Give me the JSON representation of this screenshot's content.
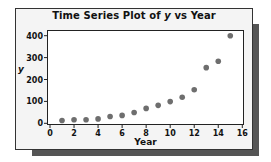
{
  "chart_data": {
    "type": "scatter",
    "title": "Time Series Plot of y vs Year",
    "title_parts": {
      "prefix": "Time Series Plot of ",
      "var": "y",
      "suffix": " vs Year"
    },
    "xlabel": "Year",
    "ylabel": "y",
    "xlim": [
      0,
      16
    ],
    "ylim": [
      0,
      400
    ],
    "xticks": [
      0,
      2,
      4,
      6,
      8,
      10,
      12,
      14,
      16
    ],
    "yticks": [
      0,
      100,
      200,
      300,
      400
    ],
    "grid": false,
    "legend": null,
    "series": [
      {
        "name": "y",
        "color": "#6e6e6e",
        "x": [
          1,
          2,
          3,
          4,
          5,
          6,
          7,
          8,
          9,
          10,
          11,
          12,
          13,
          14,
          15
        ],
        "y": [
          13,
          16,
          16,
          20,
          31,
          36,
          49,
          68,
          82,
          99,
          119,
          153,
          254,
          283,
          400
        ]
      }
    ]
  }
}
